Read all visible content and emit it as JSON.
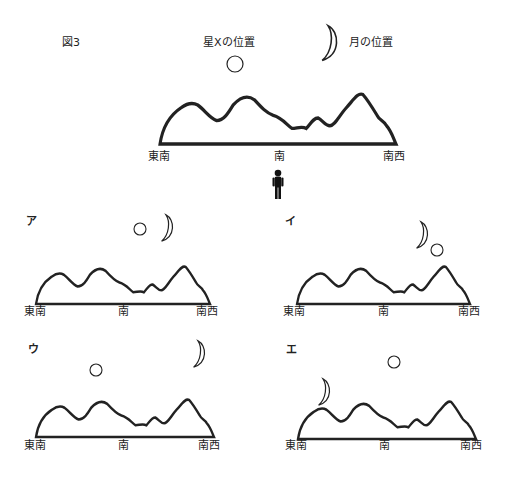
{
  "figure": {
    "title": "図3",
    "legend": {
      "star_label": "星Xの位置",
      "moon_label": "月の位置"
    },
    "main": {
      "directions": [
        "東南",
        "南",
        "南西"
      ]
    }
  },
  "options": [
    {
      "label": "ア",
      "directions": [
        "東南",
        "南",
        "南西"
      ],
      "arrangement": "star left of moon, both high near south-southwest"
    },
    {
      "label": "イ",
      "directions": [
        "東南",
        "南",
        "南西"
      ],
      "arrangement": "moon upper-left of star, near southwest"
    },
    {
      "label": "ウ",
      "directions": [
        "東南",
        "南",
        "南西"
      ],
      "arrangement": "star low toward southeast, moon high near southwest"
    },
    {
      "label": "エ",
      "directions": [
        "東南",
        "南",
        "南西"
      ],
      "arrangement": "moon low near southeast, star higher near south"
    }
  ],
  "colors": {
    "line": "#222222",
    "figure": "#111111",
    "background": "#ffffff"
  }
}
